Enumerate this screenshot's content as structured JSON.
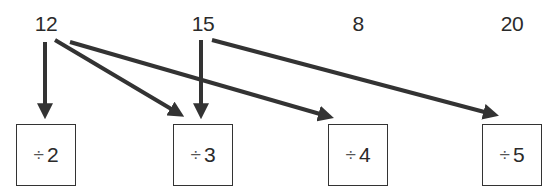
{
  "numbers": [
    {
      "label": "12",
      "x": 46
    },
    {
      "label": "15",
      "x": 203
    },
    {
      "label": "8",
      "x": 358
    },
    {
      "label": "20",
      "x": 512
    }
  ],
  "boxes": [
    {
      "operator": "÷",
      "divisor": "2",
      "left": 16
    },
    {
      "operator": "÷",
      "divisor": "3",
      "left": 173
    },
    {
      "operator": "÷",
      "divisor": "4",
      "left": 328
    },
    {
      "operator": "÷",
      "divisor": "5",
      "left": 482
    }
  ],
  "arrows": [
    {
      "from": "12",
      "to": "÷ 2"
    },
    {
      "from": "12",
      "to": "÷ 3"
    },
    {
      "from": "12",
      "to": "÷ 4"
    },
    {
      "from": "15",
      "to": "÷ 3"
    },
    {
      "from": "15",
      "to": "÷ 5"
    }
  ],
  "colors": {
    "arrow": "#333333",
    "text": "#2a2a2a",
    "box_border": "#333333"
  }
}
